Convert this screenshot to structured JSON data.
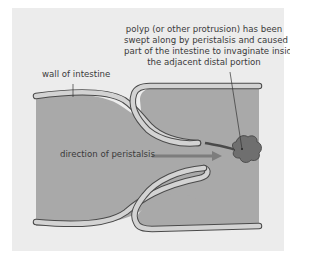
{
  "diagram": {
    "labels": {
      "polyp": [
        "polyp (or other protrusion) has been",
        "swept along by peristalsis and caused",
        "part of the intestine to invaginate inside",
        "the adjacent distal portion"
      ],
      "wall": "wall of intestine",
      "direction": "direction of peristalsis"
    },
    "colors": {
      "background_frame": "#ececec",
      "lumen": "#a9a9a9",
      "wall_fill": "#d3d3d3",
      "outline": "#4a4a4a",
      "polyp": "#6f6f6f",
      "arrow": "#7d7d7d",
      "text": "#3a3a3a"
    }
  }
}
